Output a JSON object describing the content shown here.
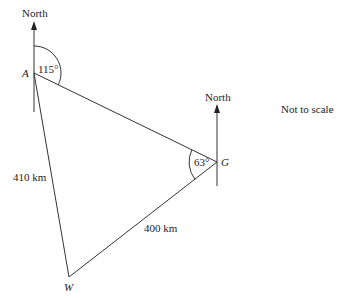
{
  "diagram": {
    "note": "Not to scale",
    "north_label_a": "North",
    "north_label_g": "North",
    "points": {
      "A": {
        "label": "A",
        "x": 34,
        "y": 73
      },
      "G": {
        "label": "G",
        "x": 217,
        "y": 162
      },
      "W": {
        "label": "W",
        "x": 69,
        "y": 277
      }
    },
    "angles": {
      "A": "115°",
      "G": "63°"
    },
    "sides": {
      "AW": "410 km",
      "GW": "400 km"
    },
    "line_color": "#333333"
  }
}
